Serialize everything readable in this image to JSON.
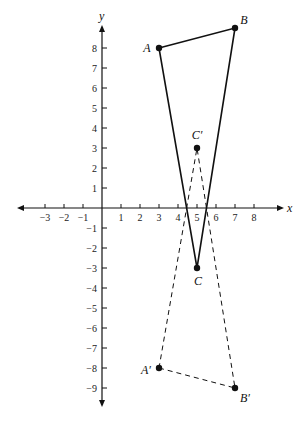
{
  "diagram": {
    "axes": {
      "x_label": "x",
      "y_label": "y",
      "x_ticks": [
        -3,
        -2,
        -1,
        1,
        2,
        3,
        4,
        5,
        6,
        7,
        8
      ],
      "x_tick_labels": [
        "−3",
        "−2",
        "−1",
        "1",
        "2",
        "3",
        "4",
        "5",
        "6",
        "7",
        "8"
      ],
      "y_ticks": [
        8,
        7,
        6,
        5,
        4,
        3,
        2,
        1,
        -1,
        -2,
        -3,
        -4,
        -5,
        -6,
        -7,
        -8,
        -9
      ],
      "y_tick_labels": [
        "8",
        "7",
        "6",
        "5",
        "4",
        "3",
        "2",
        "1",
        "−1",
        "−2",
        "−3",
        "−4",
        "−5",
        "−6",
        "−7",
        "−8",
        "−9"
      ]
    },
    "triangle_original": {
      "style": "solid",
      "points": [
        {
          "name": "A",
          "label": "A",
          "x": 3,
          "y": 8
        },
        {
          "name": "B",
          "label": "B",
          "x": 7,
          "y": 9
        },
        {
          "name": "C",
          "label": "C",
          "x": 5,
          "y": -3
        }
      ]
    },
    "triangle_image": {
      "style": "dashed",
      "points": [
        {
          "name": "A'",
          "label": "A′",
          "x": 3,
          "y": -8
        },
        {
          "name": "B'",
          "label": "B′",
          "x": 7,
          "y": -9
        },
        {
          "name": "C'",
          "label": "C′",
          "x": 5,
          "y": 3
        }
      ]
    },
    "colors": {
      "ink": "#111111",
      "background": "#ffffff"
    }
  }
}
